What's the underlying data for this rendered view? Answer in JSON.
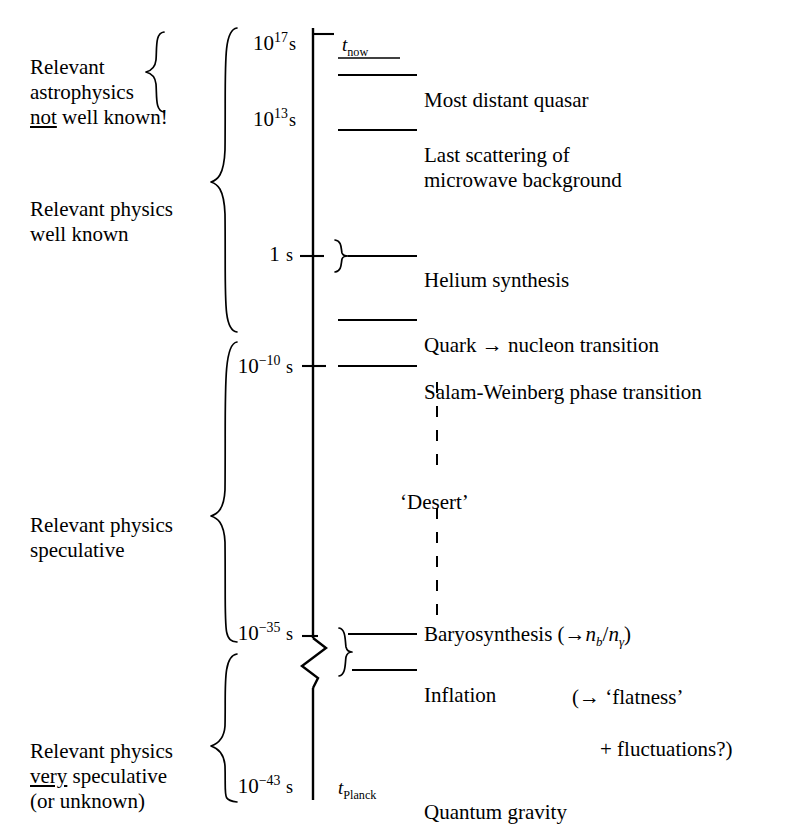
{
  "figure": {
    "type": "timeline-diagram",
    "axis_orientation": "vertical, time decreasing downward",
    "background_color": "#ffffff",
    "ink_color": "#000000"
  },
  "era_brackets": [
    {
      "id": "astrophysics-not-well-known",
      "text": "Relevant\nastrophysics\nnot well known!",
      "underlined_word": "not",
      "spans_ticks": [
        "10^17 s",
        "10^13 s"
      ]
    },
    {
      "id": "physics-well-known",
      "text": "Relevant physics\nwell known",
      "underlined_word": "",
      "spans_ticks": [
        "10^17 s",
        "quark-nucleon"
      ]
    },
    {
      "id": "physics-speculative",
      "text": "Relevant physics\nspeculative",
      "underlined_word": "",
      "spans_ticks": [
        "10^-10 s",
        "10^-35 s"
      ]
    },
    {
      "id": "physics-very-speculative",
      "text": "Relevant physics\nvery speculative\n(or unknown)",
      "underlined_word": "very",
      "spans_ticks": [
        "10^-35 s",
        "10^-43 s"
      ]
    }
  ],
  "axis_ticks": [
    {
      "id": "t17",
      "mantissa": "10",
      "exponent": "17",
      "unit": "s",
      "has_tick_mark": true
    },
    {
      "id": "t13",
      "mantissa": "10",
      "exponent": "13",
      "unit": "s",
      "has_tick_mark": false
    },
    {
      "id": "t1",
      "mantissa": "1",
      "exponent": "",
      "unit": "s",
      "has_tick_mark": true
    },
    {
      "id": "tm10",
      "mantissa": "10",
      "exponent": "-10",
      "unit": "s",
      "has_tick_mark": true
    },
    {
      "id": "tm35",
      "mantissa": "10",
      "exponent": "-35",
      "unit": "s",
      "has_tick_mark": true
    },
    {
      "id": "tm43",
      "mantissa": "10",
      "exponent": "-43",
      "unit": "s",
      "has_tick_mark": false
    }
  ],
  "time_markers": [
    {
      "id": "t-now",
      "symbol": "t",
      "subscript": "now"
    },
    {
      "id": "t-planck",
      "symbol": "t",
      "subscript": "Planck"
    }
  ],
  "events": [
    {
      "id": "quasar",
      "label": "Most distant quasar",
      "connector": "line",
      "tick": "10^17 s"
    },
    {
      "id": "last-scattering",
      "label": "Last scattering of\nmicrowave background",
      "connector": "line",
      "tick": "10^13 s"
    },
    {
      "id": "helium",
      "label": "Helium synthesis",
      "connector": "brace-line",
      "tick": "1 s"
    },
    {
      "id": "quark-nucleon",
      "label": "Quark → nucleon transition",
      "connector": "line",
      "tick": ""
    },
    {
      "id": "salam-weinberg",
      "label": "Salam-Weinberg phase transition",
      "connector": "line",
      "tick": "10^-10 s"
    },
    {
      "id": "baryosynthesis",
      "label": "Baryosynthesis (→n_b/n_γ)",
      "connector": "line",
      "tick": "10^-35 s"
    },
    {
      "id": "inflation",
      "label": "Inflation",
      "connector": "brace-line",
      "tick": "10^-35 s"
    },
    {
      "id": "quantum-gravity",
      "label": "Quantum gravity",
      "connector": "none",
      "tick": "10^-43 s"
    }
  ],
  "baryosynthesis": {
    "prefix": "Baryosynthesis (",
    "arrow": "→",
    "n_symbol": "n",
    "sub_b": "b",
    "slash": "/",
    "sub_gamma": "γ",
    "suffix": ")"
  },
  "inflation_note": {
    "line1": "(→ ‘flatness’",
    "line2": "+ fluctuations?)"
  },
  "desert": {
    "label": "‘Desert’",
    "style": "dashed vertical line"
  },
  "axis_break": {
    "style": "zigzag",
    "between": [
      "10^-35 s",
      "10^-43 s"
    ]
  }
}
